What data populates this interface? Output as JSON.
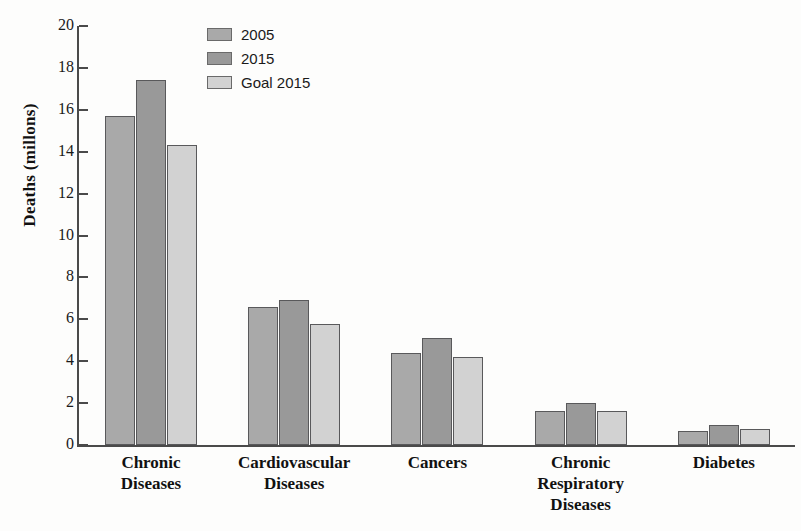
{
  "chart_data": {
    "type": "bar",
    "title": "",
    "xlabel": "",
    "ylabel": "Deaths (millons)",
    "ylim": [
      0,
      20
    ],
    "ytick_values": [
      20,
      18,
      16,
      14,
      12,
      10,
      8,
      6,
      4,
      2,
      0
    ],
    "ytick_labels": [
      "20",
      "18",
      "16",
      "14",
      "12",
      "10",
      "8",
      "6",
      "4",
      "2",
      "0"
    ],
    "grid": false,
    "legend_position": "top-left-inside",
    "categories": [
      "Chronic Diseases",
      "Cardiovascular Diseases",
      "Cancers",
      "Chronic Respiratory Diseases",
      "Diabetes"
    ],
    "category_lines": [
      [
        "Chronic",
        "Diseases"
      ],
      [
        "Cardiovascular",
        "Diseases"
      ],
      [
        "Cancers"
      ],
      [
        "Chronic",
        "Respiratory",
        "Diseases"
      ],
      [
        "Diabetes"
      ]
    ],
    "series": [
      {
        "name": "2005",
        "color": "#a9a9a9",
        "values": [
          15.7,
          6.6,
          4.4,
          1.6,
          0.65
        ]
      },
      {
        "name": "2015",
        "color": "#999999",
        "values": [
          17.4,
          6.9,
          5.1,
          2.0,
          0.95
        ]
      },
      {
        "name": "Goal 2015",
        "color": "#d2d2d2",
        "values": [
          14.3,
          5.8,
          4.2,
          1.6,
          0.75
        ]
      }
    ]
  },
  "legend": {
    "items": [
      {
        "label": "2005",
        "color": "#a9a9a9"
      },
      {
        "label": "2015",
        "color": "#999999"
      },
      {
        "label": "Goal 2015",
        "color": "#d2d2d2"
      }
    ]
  },
  "axes": {
    "y_title": "Deaths (millons)"
  },
  "colors": {
    "axis": "#4a4a4a",
    "bar_outline": "#59595b",
    "background": "#fdfdfc",
    "text": "#111111"
  }
}
